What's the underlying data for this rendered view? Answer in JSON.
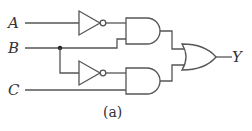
{
  "diagram": {
    "type": "logic-circuit",
    "caption": "(a)",
    "inputs": [
      {
        "label": "A"
      },
      {
        "label": "B"
      },
      {
        "label": "C"
      }
    ],
    "output": {
      "label": "Y"
    },
    "gates": [
      {
        "id": "not1",
        "type": "NOT",
        "input": "A"
      },
      {
        "id": "not2",
        "type": "NOT",
        "input": "B"
      },
      {
        "id": "and1",
        "type": "AND",
        "inputs": [
          "not1",
          "B"
        ]
      },
      {
        "id": "and2",
        "type": "AND",
        "inputs": [
          "not2",
          "C"
        ]
      },
      {
        "id": "or1",
        "type": "OR",
        "inputs": [
          "and1",
          "and2"
        ],
        "output": "Y"
      }
    ],
    "expression": "Y = A'B + B'C",
    "colors": {
      "line": "#555555",
      "text": "#333333",
      "background": "#ffffff"
    }
  }
}
